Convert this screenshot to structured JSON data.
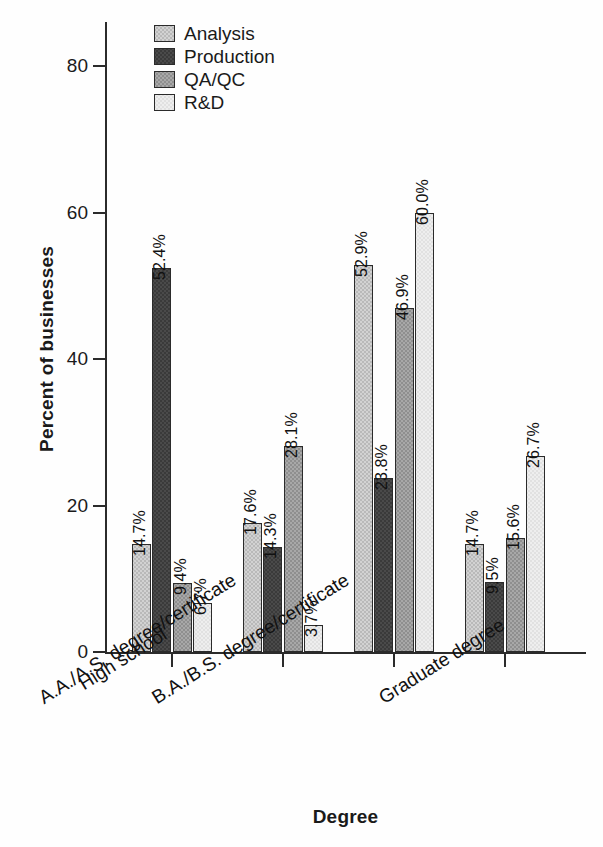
{
  "chart_data": {
    "type": "bar",
    "title": "",
    "xlabel": "Degree",
    "ylabel": "Percent of businesses",
    "ylim": [
      0,
      88
    ],
    "yticks": [
      0,
      20,
      40,
      60,
      80
    ],
    "ytick_labels": [
      "0",
      "20",
      "40",
      "60",
      "80"
    ],
    "grid": false,
    "legend_position": "top-left",
    "value_label_format": "percent-one-decimal",
    "value_labels_rotated": true,
    "categories": [
      "High school",
      "A.A./A.S. degree/certificate",
      "B.A./B.S. degree/certificate",
      "Graduate degree"
    ],
    "series": [
      {
        "name": "Analysis",
        "color": "#d2d2d2",
        "values": [
          14.7,
          17.6,
          52.9,
          14.7
        ],
        "labels": [
          "14.7%",
          "17.6%",
          "52.9%",
          "14.7%"
        ]
      },
      {
        "name": "Production",
        "color": "#4a4a4a",
        "values": [
          52.4,
          14.3,
          23.8,
          9.5
        ],
        "labels": [
          "52.4%",
          "14.3%",
          "23.8%",
          "9.5%"
        ]
      },
      {
        "name": "QA/QC",
        "color": "#a8a8a8",
        "values": [
          9.4,
          28.1,
          46.9,
          15.6
        ],
        "labels": [
          "9.4%",
          "28.1%",
          "46.9%",
          "15.6%"
        ]
      },
      {
        "name": "R&D",
        "color": "#eeeeee",
        "values": [
          6.7,
          3.7,
          60.0,
          26.7
        ],
        "labels": [
          "6.7%",
          "3.7%",
          "60.0%",
          "26.7%"
        ]
      }
    ]
  },
  "legend": {
    "items": [
      {
        "label": "Analysis",
        "swatch": "#d2d2d2"
      },
      {
        "label": "Production",
        "swatch": "#4a4a4a"
      },
      {
        "label": "QA/QC",
        "swatch": "#a8a8a8"
      },
      {
        "label": "R&D",
        "swatch": "#eeeeee"
      }
    ]
  },
  "axes": {
    "y_title": "Percent of businesses",
    "x_title": "Degree",
    "y_tick_labels": [
      "0",
      "20",
      "40",
      "60",
      "80"
    ]
  },
  "colors": {
    "axis": "#2b2b2b",
    "text": "#111111",
    "background": "#ffffff"
  }
}
